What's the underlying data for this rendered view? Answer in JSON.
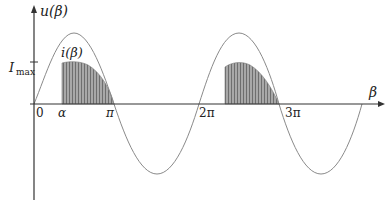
{
  "diagram": {
    "y_axis_label": "u(β)",
    "x_axis_label": "β",
    "current_label": "i(β)",
    "imax_label": "I",
    "imax_sub": "max",
    "ticks": {
      "zero": "0",
      "alpha": "α",
      "pi": "π",
      "two_pi": "2π",
      "three_pi": "3π"
    },
    "colors": {
      "axis": "#333333",
      "voltage_curve": "#8a8a8a",
      "current_fill": "#9a9a9a",
      "current_stripes": "#6e6e6e"
    }
  }
}
